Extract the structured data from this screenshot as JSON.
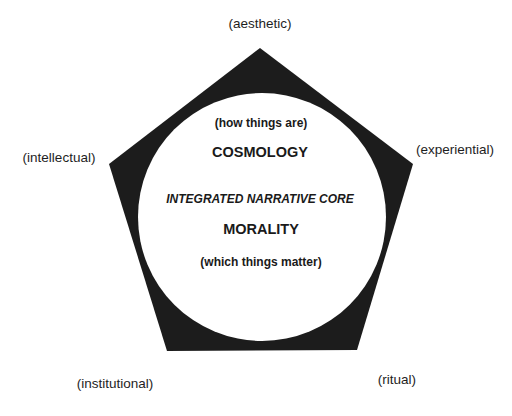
{
  "diagram": {
    "shape": "pentagon-with-inscribed-circle",
    "colors": {
      "pentagon_fill": "#1c1c1c",
      "circle_fill": "#ffffff",
      "background": "#ffffff",
      "text": "#1a1a1a"
    },
    "pentagon_vertices": [
      [
        260,
        48
      ],
      [
        413,
        164
      ],
      [
        357,
        350
      ],
      [
        167,
        351
      ],
      [
        109,
        164
      ]
    ],
    "circle": {
      "cx": 262,
      "cy": 217,
      "r": 124
    },
    "outer_labels": {
      "top": "(aesthetic)",
      "left": "(intellectual)",
      "right": "(experiential)",
      "bottom_left": "(institutional)",
      "bottom_right": "(ritual)"
    },
    "inner": {
      "cosmology_sub": "(how things are)",
      "cosmology": "COSMOLOGY",
      "core": "INTEGRATED NARRATIVE CORE",
      "morality": "MORALITY",
      "morality_sub": "(which things matter)"
    }
  }
}
